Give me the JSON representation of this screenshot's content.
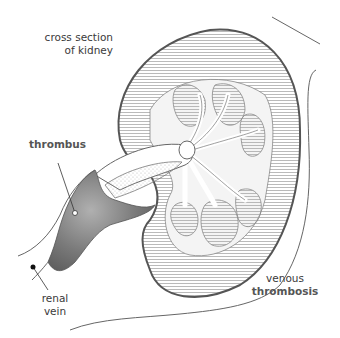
{
  "diagram": {
    "labels": {
      "cross_section_line1": "cross section",
      "cross_section_line2": "of kidney",
      "thrombus": "thrombus",
      "renal_line1": "renal",
      "renal_line2": "vein",
      "venous_line1": "venous",
      "venous_line2": "thrombosis"
    },
    "colors": {
      "outline": "#555555",
      "hatch": "#9a9a9a",
      "thrombus_fill": "#6e6e6e",
      "vessel_fill": "#ffffff",
      "background": "#ffffff"
    }
  }
}
